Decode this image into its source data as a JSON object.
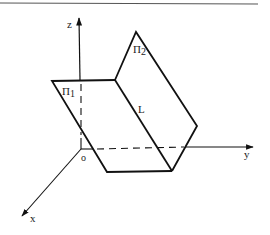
{
  "figure": {
    "axes": {
      "z_label": "z",
      "y_label": "y",
      "x_label": "x",
      "origin_label": "o"
    },
    "planes": {
      "plane1_label": "Π",
      "plane1_sub": "1",
      "plane2_label": "Π",
      "plane2_sub": "2"
    },
    "line_label": "L",
    "colors": {
      "stroke": "#111111",
      "rule": "#555555"
    }
  }
}
